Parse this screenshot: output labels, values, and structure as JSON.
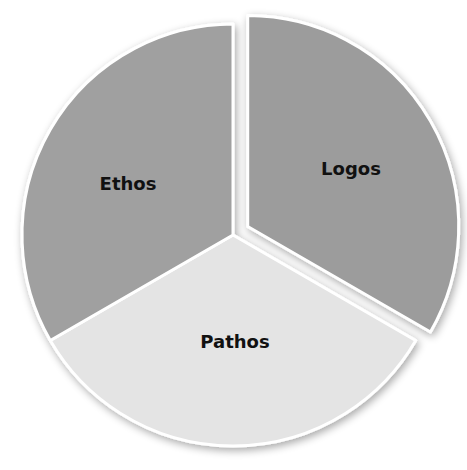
{
  "chart_data": {
    "type": "pie",
    "title": "",
    "categories": [
      "Logos",
      "Pathos",
      "Ethos"
    ],
    "values": [
      33.33,
      33.33,
      33.33
    ],
    "colors": [
      "#9c9c9c",
      "#e4e4e4",
      "#a0a0a0"
    ],
    "exploded": [
      "Logos"
    ],
    "legend": "none (labels inside slices)",
    "start_angle_deg": 0,
    "direction": "clockwise"
  },
  "labels": {
    "logos": "Logos",
    "pathos": "Pathos",
    "ethos": "Ethos"
  }
}
